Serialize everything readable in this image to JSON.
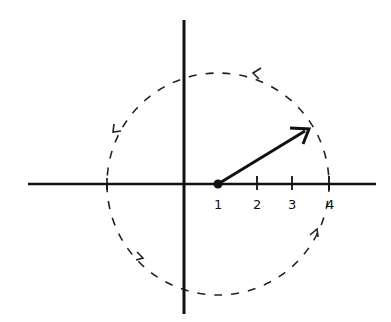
{
  "diagram": {
    "type": "complex-plane-rotation",
    "axes": {
      "origin": [
        184,
        184
      ],
      "x_range_px": [
        28,
        376
      ],
      "y_range_px": [
        20,
        314
      ]
    },
    "ticks": [
      {
        "label": "1",
        "x": 218
      },
      {
        "label": "2",
        "x": 257
      },
      {
        "label": "3",
        "x": 292
      },
      {
        "label": "4",
        "x": 329
      }
    ],
    "center_point": {
      "value": "1",
      "x": 218,
      "y": 184
    },
    "vector": {
      "from": [
        218,
        184
      ],
      "to": [
        309,
        129
      ]
    },
    "circle": {
      "style": "dashed",
      "direction": "counterclockwise",
      "cx": 218,
      "cy": 184,
      "r": 111
    },
    "colors": {
      "stroke": "#111111",
      "background": "#ffffff"
    }
  }
}
